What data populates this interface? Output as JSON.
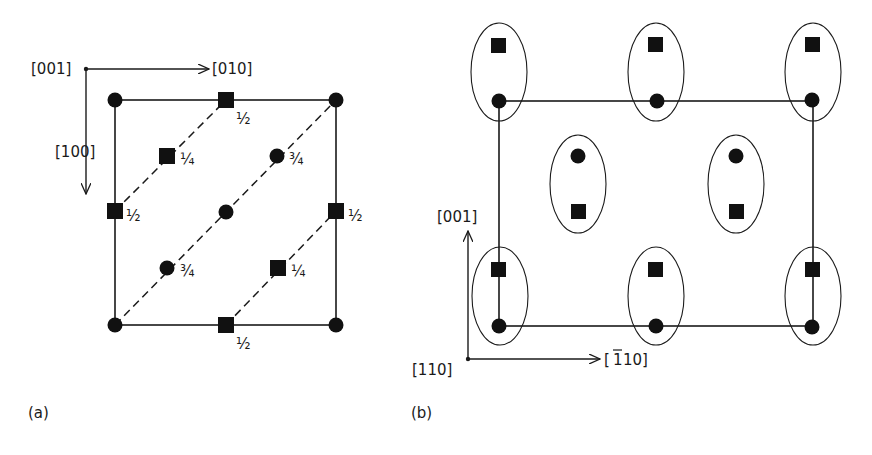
{
  "panel_a": {
    "caption": "(a)",
    "axes": {
      "origin_label": "[001]",
      "x_label": "[010]",
      "y_label": "[100]"
    },
    "fractions": {
      "half": "½",
      "quarter": "¼",
      "three_quarter": "¾"
    },
    "atoms": [
      {
        "type": "circle",
        "x": 115,
        "y": 100,
        "label": ""
      },
      {
        "type": "circle",
        "x": 336,
        "y": 100,
        "label": ""
      },
      {
        "type": "circle",
        "x": 115,
        "y": 325,
        "label": ""
      },
      {
        "type": "circle",
        "x": 336,
        "y": 325,
        "label": ""
      },
      {
        "type": "circle",
        "x": 226,
        "y": 212,
        "label": ""
      },
      {
        "type": "circle",
        "x": 277,
        "y": 156,
        "label": "¾"
      },
      {
        "type": "circle",
        "x": 167,
        "y": 268,
        "label": "¾"
      },
      {
        "type": "square",
        "x": 226,
        "y": 100,
        "label": "½"
      },
      {
        "type": "square",
        "x": 115,
        "y": 211,
        "label": "½"
      },
      {
        "type": "square",
        "x": 336,
        "y": 211,
        "label": "½"
      },
      {
        "type": "square",
        "x": 226,
        "y": 325,
        "label": "½"
      },
      {
        "type": "square",
        "x": 167,
        "y": 156,
        "label": "¼"
      },
      {
        "type": "square",
        "x": 278,
        "y": 268,
        "label": "¼"
      }
    ]
  },
  "panel_b": {
    "caption": "(b)",
    "axes": {
      "origin_label": "[110]",
      "x_label": "[̅110]",
      "x_label_bar": "1",
      "x_label_rest": "10",
      "y_label": "[001]"
    },
    "pairs": [
      {
        "cx": 499,
        "cy": 72,
        "top": "square",
        "bottom": "circle"
      },
      {
        "cx": 656,
        "cy": 72,
        "top": "square",
        "bottom": "circle"
      },
      {
        "cx": 813,
        "cy": 72,
        "top": "square",
        "bottom": "circle"
      },
      {
        "cx": 578,
        "cy": 184,
        "top": "circle",
        "bottom": "square"
      },
      {
        "cx": 736,
        "cy": 184,
        "top": "circle",
        "bottom": "square"
      },
      {
        "cx": 499,
        "cy": 296,
        "top": "square",
        "bottom": "circle"
      },
      {
        "cx": 656,
        "cy": 296,
        "top": "square",
        "bottom": "circle"
      },
      {
        "cx": 813,
        "cy": 296,
        "top": "square",
        "bottom": "circle"
      }
    ]
  }
}
